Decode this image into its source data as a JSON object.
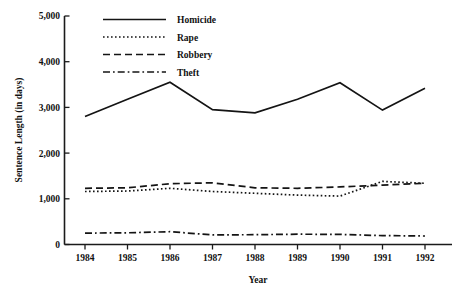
{
  "chart_data": {
    "type": "line",
    "title": "",
    "xlabel": "Year",
    "ylabel": "Sentence Length (in days)",
    "x": [
      "1984",
      "1985",
      "1986",
      "1987",
      "1988",
      "1989",
      "1990",
      "1991",
      "1992"
    ],
    "xtick_labels": [
      "1984",
      "1985",
      "1986",
      "1987",
      "1988",
      "1989",
      "1990",
      "1991",
      "1992"
    ],
    "ytick_labels": [
      "0",
      "1,000",
      "2,000",
      "3,000",
      "4,000",
      "5,000"
    ],
    "ytick_values": [
      0,
      1000,
      2000,
      3000,
      4000,
      5000
    ],
    "ylim": [
      0,
      5000
    ],
    "grid": false,
    "legend_position": "top-left-inside",
    "series": [
      {
        "name": "Homicide",
        "style": "solid",
        "values": [
          2800,
          3180,
          3550,
          2950,
          2880,
          3180,
          3540,
          2940,
          3420
        ]
      },
      {
        "name": "Rape",
        "style": "dotted",
        "values": [
          1160,
          1170,
          1230,
          1160,
          1120,
          1080,
          1060,
          1380,
          1340
        ]
      },
      {
        "name": "Robbery",
        "style": "dashed",
        "values": [
          1230,
          1240,
          1330,
          1350,
          1240,
          1230,
          1260,
          1300,
          1340
        ]
      },
      {
        "name": "Theft",
        "style": "dash-dot",
        "values": [
          250,
          255,
          280,
          210,
          215,
          225,
          220,
          195,
          185
        ]
      }
    ]
  },
  "legend": {
    "items": [
      {
        "label": "Homicide",
        "style": "solid"
      },
      {
        "label": "Rape",
        "style": "dotted"
      },
      {
        "label": "Robbery",
        "style": "dashed"
      },
      {
        "label": "Theft",
        "style": "dash-dot"
      }
    ]
  },
  "colors": {
    "ink": "#141414",
    "background": "#ffffff"
  }
}
